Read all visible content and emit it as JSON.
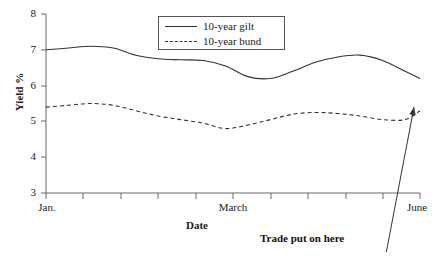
{
  "chart_data": {
    "type": "line",
    "title": "",
    "xlabel": "Date",
    "ylabel": "Yield %",
    "ylim": [
      3,
      8
    ],
    "yticks": [
      "3",
      "4",
      "5",
      "6",
      "7",
      "8"
    ],
    "xlim": [
      0,
      5
    ],
    "xtick_labels": [
      "Jan.",
      "March",
      "June"
    ],
    "xtick_positions": [
      0,
      2.5,
      5
    ],
    "grid": false,
    "legend_position": "top-center",
    "series": [
      {
        "name": "10-year gilt",
        "style": "solid",
        "color": "#333333",
        "x": [
          0,
          0.3,
          0.6,
          0.9,
          1.2,
          1.5,
          1.8,
          2.1,
          2.4,
          2.7,
          3.0,
          3.3,
          3.6,
          3.9,
          4.2,
          4.5,
          4.8,
          5.0
        ],
        "values": [
          7.0,
          7.05,
          7.1,
          7.05,
          6.85,
          6.75,
          6.72,
          6.7,
          6.55,
          6.25,
          6.2,
          6.4,
          6.65,
          6.8,
          6.85,
          6.7,
          6.4,
          6.2
        ]
      },
      {
        "name": "10-year bund",
        "style": "dashed",
        "color": "#333333",
        "x": [
          0,
          0.3,
          0.6,
          0.9,
          1.2,
          1.5,
          1.8,
          2.1,
          2.4,
          2.7,
          3.0,
          3.3,
          3.6,
          3.9,
          4.2,
          4.5,
          4.8,
          5.0
        ],
        "values": [
          5.4,
          5.45,
          5.5,
          5.45,
          5.3,
          5.15,
          5.05,
          4.95,
          4.8,
          4.9,
          5.05,
          5.2,
          5.25,
          5.22,
          5.15,
          5.05,
          5.05,
          5.3
        ]
      }
    ],
    "annotations": [
      {
        "text": "Trade put on here",
        "arrow_from": [
          4.55,
          2.72
        ],
        "arrow_to": [
          4.92,
          5.4
        ]
      }
    ]
  }
}
